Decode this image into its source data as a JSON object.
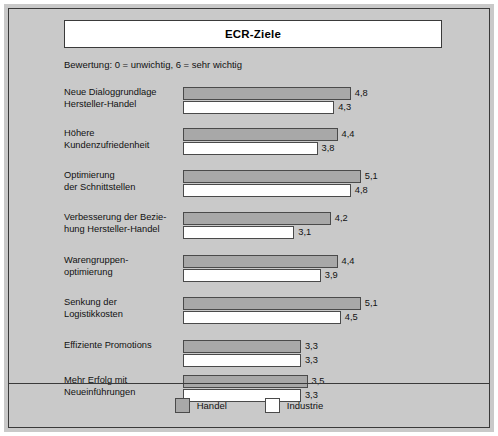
{
  "figure": {
    "title": "ECR-Ziele",
    "subtitle": "Bewertung: 0 = unwichtig, 6 = sehr wichtig"
  },
  "legend": {
    "items": [
      {
        "label": "Handel",
        "color": "#a8a8a8"
      },
      {
        "label": "Industrie",
        "color": "#ffffff"
      }
    ]
  },
  "colors": {
    "background": "#c9c9c9",
    "handel": "#a8a8a8",
    "industrie": "#ffffff",
    "border": "#3a3a3a",
    "text": "#111111"
  },
  "chart_data": {
    "type": "bar",
    "orientation": "horizontal",
    "title": "ECR-Ziele",
    "subtitle": "Bewertung: 0 = unwichtig, 6 = sehr wichtig",
    "xlabel": "",
    "ylabel": "",
    "xlim": [
      0,
      6
    ],
    "grid": false,
    "legend_position": "bottom",
    "categories": [
      "Neue Dialoggrundlage Hersteller-Handel",
      "Höhere Kundenzufriedenheit",
      "Optimierung der Schnittstellen",
      "Verbesserung der Beziehung Hersteller-Handel",
      "Warengruppen-optimierung",
      "Senkung der Logistikkosten",
      "Effiziente Promotions",
      "Mehr Erfolg mit Neueinführungen"
    ],
    "category_lines": [
      [
        "Neue Dialoggrundlage",
        "Hersteller-Handel"
      ],
      [
        "Höhere",
        "Kundenzufriedenheit"
      ],
      [
        "Optimierung",
        "der Schnittstellen"
      ],
      [
        "Verbesserung der Bezie-",
        "hung Hersteller-Handel"
      ],
      [
        "Warengruppen-",
        "optimierung"
      ],
      [
        "Senkung der",
        "Logistikkosten"
      ],
      [
        "Effiziente Promotions",
        ""
      ],
      [
        "Mehr Erfolg mit",
        "Neueinführungen"
      ]
    ],
    "series": [
      {
        "name": "Handel",
        "values": [
          4.8,
          4.4,
          5.1,
          4.2,
          4.4,
          5.1,
          3.3,
          3.5
        ],
        "labels": [
          "4,8",
          "4,4",
          "5,1",
          "4,2",
          "4,4",
          "5,1",
          "3,3",
          "3,5"
        ]
      },
      {
        "name": "Industrie",
        "values": [
          4.3,
          3.8,
          4.8,
          3.1,
          3.9,
          4.5,
          3.3,
          3.3
        ],
        "labels": [
          "4,3",
          "3,8",
          "4,8",
          "3,1",
          "3,9",
          "4,5",
          "3,3",
          "3,3"
        ]
      }
    ]
  }
}
